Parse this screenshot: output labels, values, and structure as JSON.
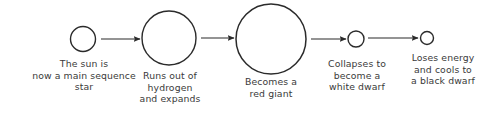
{
  "diagram": {
    "type": "flow-diagram",
    "background_color": "#ffffff",
    "stroke_color": "#2b2b2b",
    "text_color": "#3a3a3a",
    "stages": [
      {
        "id": "main-sequence",
        "label": "The sun is\nnow a main sequence\nstar",
        "circle_diameter_px": 25,
        "center_x": 83,
        "center_y": 39
      },
      {
        "id": "expanding",
        "label": "Runs out of\nhydrogen\nand expands",
        "circle_diameter_px": 54,
        "center_x": 169,
        "center_y": 38
      },
      {
        "id": "red-giant",
        "label": "Becomes a\nred giant",
        "circle_diameter_px": 70,
        "center_x": 271,
        "center_y": 39
      },
      {
        "id": "white-dwarf",
        "label": "Collapses to\nbecome a\nwhite dwarf",
        "circle_diameter_px": 16,
        "center_x": 356,
        "center_y": 39
      },
      {
        "id": "black-dwarf",
        "label": "Loses energy\nand cools to\na black dwarf",
        "circle_diameter_px": 13,
        "center_x": 427,
        "center_y": 38
      }
    ],
    "arrows": [
      {
        "id": "arrow-1",
        "from": "main-sequence",
        "to": "expanding",
        "x1": 101,
        "x2": 140,
        "y": 39
      },
      {
        "id": "arrow-2",
        "from": "expanding",
        "to": "red-giant",
        "x1": 201,
        "x2": 234,
        "y": 38
      },
      {
        "id": "arrow-3",
        "from": "red-giant",
        "to": "white-dwarf",
        "x1": 311,
        "x2": 346,
        "y": 39
      },
      {
        "id": "arrow-4",
        "from": "white-dwarf",
        "to": "black-dwarf",
        "x1": 368,
        "x2": 418,
        "y": 38
      }
    ]
  }
}
